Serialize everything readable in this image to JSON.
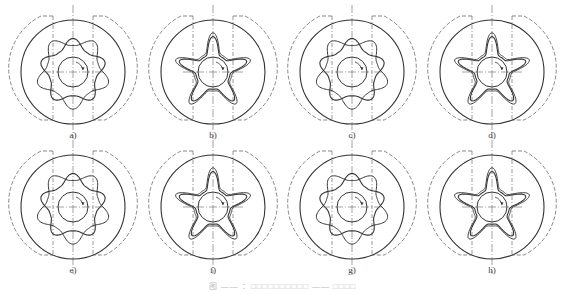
{
  "figure": {
    "caption": "图 —— ：□□□□□□□□□□ —— □□□□",
    "caption_legible": false,
    "panels": [
      {
        "id": "a",
        "label": "a)",
        "variant": "rounded-square",
        "cx": 73,
        "cy": 72
      },
      {
        "id": "b",
        "label": "b)",
        "variant": "star",
        "cx": 213,
        "cy": 72
      },
      {
        "id": "c",
        "label": "c)",
        "variant": "rounded-square",
        "cx": 352,
        "cy": 72
      },
      {
        "id": "d",
        "label": "d)",
        "variant": "star",
        "cx": 492,
        "cy": 72
      },
      {
        "id": "e",
        "label": "e)",
        "variant": "rounded-square",
        "cx": 73,
        "cy": 207
      },
      {
        "id": "f",
        "label": "f)",
        "variant": "star",
        "cx": 213,
        "cy": 207
      },
      {
        "id": "g",
        "label": "g)",
        "variant": "rounded-square",
        "cx": 352,
        "cy": 207
      },
      {
        "id": "h",
        "label": "h)",
        "variant": "star",
        "cx": 492,
        "cy": 207
      }
    ],
    "colors": {
      "stroke": "#333333",
      "dashed": "#555555",
      "background": "#ffffff"
    }
  }
}
